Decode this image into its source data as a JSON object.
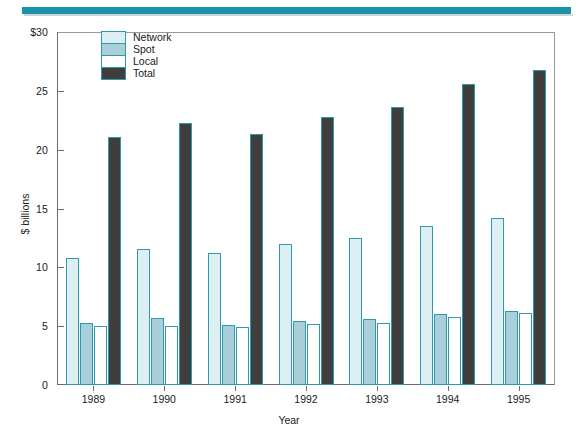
{
  "colors": {
    "rule": "#1c93a8",
    "bar_outline": "#2d9aad",
    "network": "#ddeff2",
    "spot": "#a9cfda",
    "local": "#ffffff",
    "total": "#403e3c",
    "axis": "#6d6d6d",
    "text": "#1a1a1a"
  },
  "legend": {
    "items": [
      {
        "label": "Network",
        "key": "network"
      },
      {
        "label": "Spot",
        "key": "spot"
      },
      {
        "label": "Local",
        "key": "local"
      },
      {
        "label": "Total",
        "key": "total"
      }
    ]
  },
  "axes": {
    "y_ticks": [
      "$30",
      "25",
      "20",
      "15",
      "10",
      "5",
      "0"
    ],
    "y_tick_values": [
      30,
      25,
      20,
      15,
      10,
      5,
      0
    ],
    "y_title": "$ billions",
    "x_title": "Year"
  },
  "chart_data": {
    "type": "bar",
    "title": "",
    "subtitle": "",
    "xlabel": "Year",
    "ylabel": "$ billions",
    "ylim": [
      0,
      30
    ],
    "ytick_labels": [
      "0",
      "5",
      "10",
      "15",
      "20",
      "25",
      "$30"
    ],
    "ytick_values": [
      0,
      5,
      10,
      15,
      20,
      25,
      30
    ],
    "grid": false,
    "legend_position": "top-left-inside",
    "categories": [
      "1989",
      "1990",
      "1991",
      "1992",
      "1993",
      "1994",
      "1995"
    ],
    "series": [
      {
        "name": "Network",
        "color": "#ddeff2",
        "values": [
          10.8,
          11.6,
          11.2,
          12.0,
          12.5,
          13.5,
          14.2
        ]
      },
      {
        "name": "Spot",
        "color": "#a9cfda",
        "values": [
          5.3,
          5.7,
          5.1,
          5.4,
          5.6,
          6.0,
          6.3
        ]
      },
      {
        "name": "Local",
        "color": "#ffffff",
        "values": [
          5.0,
          5.0,
          4.9,
          5.2,
          5.3,
          5.8,
          6.1
        ]
      },
      {
        "name": "Total",
        "color": "#403e3c",
        "values": [
          21.1,
          22.3,
          21.3,
          22.8,
          23.6,
          25.6,
          26.8
        ]
      }
    ]
  }
}
